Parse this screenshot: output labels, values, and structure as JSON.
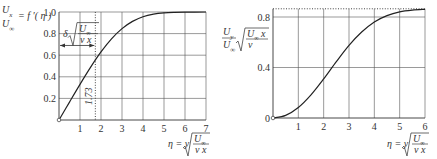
{
  "chart_data": [
    {
      "type": "line",
      "title": "Blasius velocity profile",
      "ylabel": "U_x / U_inf = f'(eta)",
      "xlabel": "eta = y sqrt(U_inf / (nu x))",
      "xlim": [
        0,
        7
      ],
      "ylim": [
        0,
        1.0
      ],
      "x_ticks": [
        "1",
        "2",
        "3",
        "4",
        "5",
        "6",
        "7"
      ],
      "y_ticks": [
        "0.2",
        "0.4",
        "0.6",
        "0.8",
        "1.0"
      ],
      "grid": true,
      "annotations": [
        {
          "text": "delta sqrt(U_inf/(nu x))",
          "type": "double-arrow",
          "y": 0.69,
          "x_range": [
            0,
            1.73
          ]
        },
        {
          "text": "1.73",
          "type": "dotted-vertical",
          "x": 1.73
        }
      ],
      "x": [
        0,
        0.5,
        1.0,
        1.5,
        2.0,
        2.5,
        3.0,
        3.5,
        4.0,
        4.5,
        5.0,
        5.5,
        6.0,
        7.0
      ],
      "values": [
        0,
        0.166,
        0.33,
        0.487,
        0.63,
        0.751,
        0.846,
        0.913,
        0.956,
        0.98,
        0.992,
        0.997,
        0.999,
        1.0
      ]
    },
    {
      "type": "line",
      "title": "Blasius transverse velocity",
      "ylabel": "U_y / U_inf * sqrt(U_inf x / nu)",
      "xlabel": "eta = y sqrt(U_inf / (nu x))",
      "xlim": [
        0,
        6
      ],
      "ylim": [
        0,
        0.86
      ],
      "x_ticks": [
        "1",
        "2",
        "3",
        "4",
        "5",
        "6"
      ],
      "y_ticks": [
        "0",
        "0.4",
        "0.8"
      ],
      "grid": true,
      "annotations": [
        {
          "text": "asymptote 0.86",
          "type": "dotted-horizontal",
          "y": 0.86
        }
      ],
      "x": [
        0,
        0.5,
        1.0,
        1.5,
        2.0,
        2.5,
        3.0,
        3.5,
        4.0,
        4.5,
        5.0,
        5.5,
        6.0
      ],
      "values": [
        0,
        0.021,
        0.083,
        0.183,
        0.309,
        0.446,
        0.575,
        0.681,
        0.761,
        0.811,
        0.841,
        0.855,
        0.861
      ]
    }
  ],
  "labels": {
    "left_y_num": "U",
    "left_y_num_sub": "x",
    "left_y_den": "U",
    "left_y_den_sub": "∞",
    "left_y_rhs": "= f ′( η )",
    "left_delta": "δ",
    "left_delta_rad_num": "U",
    "left_delta_rad_num_sub": "∞",
    "left_delta_rad_den": "ν x",
    "left_173": "1.73",
    "x_eta": "η = y",
    "x_rad_num": "U",
    "x_rad_num_sub": "∞",
    "x_rad_den": "ν x",
    "right_y_num": "U",
    "right_y_num_sub": "y",
    "right_y_den": "U",
    "right_y_den_sub": "∞",
    "right_y_rad_num": "U",
    "right_y_rad_num_sub": "∞",
    "right_y_rad_num_x": " x",
    "right_y_rad_den": "ν",
    "zero": "0"
  }
}
